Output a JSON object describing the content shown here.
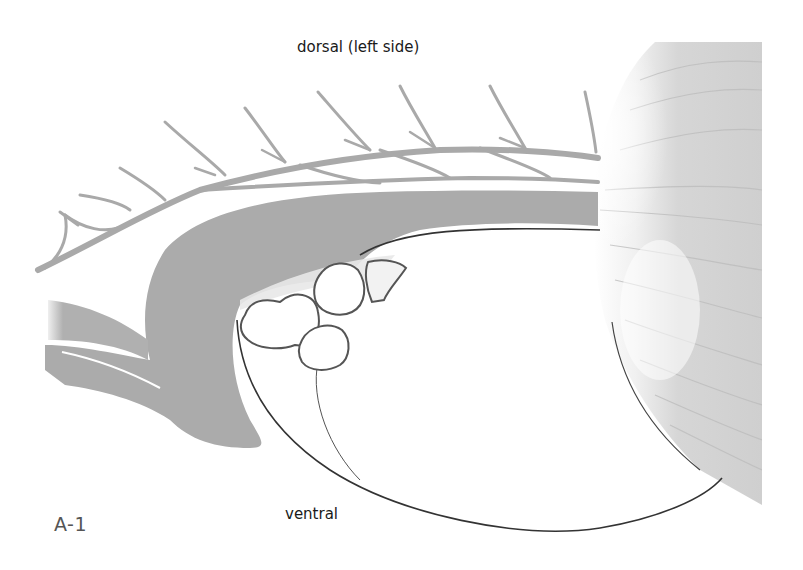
{
  "figure": {
    "id_label": "A-1",
    "orientation_top": "dorsal (left side)",
    "orientation_bottom": "ventral"
  },
  "illustration": {
    "style": "grayscale anatomical drawing",
    "colors": {
      "vessel_fill": "#b4b4b4",
      "vessel_edge": "#7a7a7a",
      "band_fill": "#a9a9a9",
      "organ_fill": "#d6d6d6",
      "outline": "#333333",
      "background": "#ffffff"
    },
    "structures": [
      {
        "name": "branching-vessel",
        "description": "branching vessel along dorsal edge"
      },
      {
        "name": "curved-band",
        "description": "thick gray curved band wrapping around upper-left"
      },
      {
        "name": "lobed-structures",
        "description": "cluster of four outlined rounded lobes"
      },
      {
        "name": "large-organ-outline",
        "description": "large white organ with thin curved outline"
      },
      {
        "name": "striated-mass",
        "description": "striated gray mass on right edge"
      }
    ]
  }
}
